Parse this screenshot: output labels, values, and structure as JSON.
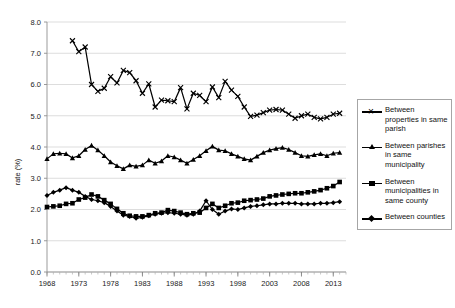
{
  "chart_data": {
    "type": "line",
    "title": "",
    "xlabel": "",
    "ylabel": "rate (%)",
    "ylim": [
      0.0,
      8.0
    ],
    "ytick_labels": [
      "0.0",
      "1.0",
      "2.0",
      "3.0",
      "4.0",
      "5.0",
      "6.0",
      "7.0",
      "8.0"
    ],
    "ytick_values": [
      0.0,
      1.0,
      2.0,
      3.0,
      4.0,
      5.0,
      6.0,
      7.0,
      8.0
    ],
    "xlim": [
      1968,
      2015
    ],
    "xtick_labels": [
      "1968",
      "1973",
      "1978",
      "1983",
      "1988",
      "1993",
      "1998",
      "2003",
      "2008",
      "2013"
    ],
    "xtick_values": [
      1968,
      1973,
      1978,
      1983,
      1988,
      1993,
      1998,
      2003,
      2008,
      2013
    ],
    "grid": "horizontal",
    "legend_position": "right",
    "x": [
      1968,
      1969,
      1970,
      1971,
      1972,
      1973,
      1974,
      1975,
      1976,
      1977,
      1978,
      1979,
      1980,
      1981,
      1982,
      1983,
      1984,
      1985,
      1986,
      1987,
      1988,
      1989,
      1990,
      1991,
      1992,
      1993,
      1994,
      1995,
      1996,
      1997,
      1998,
      1999,
      2000,
      2001,
      2002,
      2003,
      2004,
      2005,
      2006,
      2007,
      2008,
      2009,
      2010,
      2011,
      2012,
      2013,
      2014,
      2015
    ],
    "series": [
      {
        "name": "Between properties in same parish",
        "marker": "cross",
        "start_year": 1972,
        "values": [
          null,
          null,
          null,
          null,
          7.4,
          7.05,
          7.2,
          6.0,
          5.78,
          5.88,
          6.25,
          6.05,
          6.45,
          6.38,
          6.12,
          5.72,
          6.02,
          5.28,
          5.5,
          5.48,
          5.45,
          5.9,
          5.22,
          5.72,
          5.65,
          5.45,
          5.92,
          5.58,
          6.1,
          5.82,
          5.62,
          5.28,
          4.98,
          5.02,
          5.1,
          5.18,
          5.2,
          5.18,
          5.05,
          4.92,
          5.0,
          5.05,
          4.95,
          4.9,
          4.95,
          5.05,
          5.08,
          null
        ]
      },
      {
        "name": "Between parishes in same municipality",
        "marker": "triangle",
        "start_year": 1968,
        "values": [
          3.62,
          3.78,
          3.8,
          3.78,
          3.65,
          3.72,
          3.92,
          4.05,
          3.9,
          3.72,
          3.52,
          3.4,
          3.3,
          3.42,
          3.38,
          3.42,
          3.58,
          3.48,
          3.55,
          3.72,
          3.68,
          3.58,
          3.48,
          3.6,
          3.72,
          3.88,
          4.02,
          3.9,
          3.88,
          3.78,
          3.7,
          3.62,
          3.58,
          3.7,
          3.82,
          3.9,
          3.95,
          3.98,
          3.92,
          3.82,
          3.72,
          3.7,
          3.75,
          3.78,
          3.72,
          3.8,
          3.82,
          null
        ]
      },
      {
        "name": "Between municipalities in same county",
        "marker": "square",
        "start_year": 1968,
        "values": [
          2.08,
          2.1,
          2.12,
          2.18,
          2.2,
          2.32,
          2.38,
          2.48,
          2.42,
          2.3,
          2.18,
          2.02,
          1.88,
          1.8,
          1.78,
          1.78,
          1.82,
          1.88,
          1.9,
          1.98,
          1.95,
          1.9,
          1.85,
          1.88,
          1.9,
          2.05,
          2.18,
          2.05,
          2.12,
          2.2,
          2.22,
          2.28,
          2.3,
          2.32,
          2.35,
          2.42,
          2.45,
          2.48,
          2.5,
          2.52,
          2.52,
          2.55,
          2.58,
          2.62,
          2.68,
          2.75,
          2.88,
          null
        ]
      },
      {
        "name": "Between counties",
        "marker": "diamond",
        "start_year": 1968,
        "values": [
          2.45,
          2.55,
          2.62,
          2.7,
          2.62,
          2.55,
          2.42,
          2.32,
          2.28,
          2.22,
          2.1,
          1.95,
          1.82,
          1.78,
          1.72,
          1.75,
          1.8,
          1.85,
          1.88,
          1.9,
          1.88,
          1.85,
          1.82,
          1.85,
          1.95,
          2.28,
          2.0,
          1.85,
          1.95,
          2.02,
          2.0,
          2.05,
          2.1,
          2.12,
          2.15,
          2.18,
          2.18,
          2.2,
          2.2,
          2.2,
          2.18,
          2.18,
          2.18,
          2.2,
          2.2,
          2.22,
          2.25,
          null
        ]
      }
    ]
  },
  "legend": {
    "items": [
      {
        "label": "Between properties in same parish",
        "marker": "cross-marker"
      },
      {
        "label": "Between parishes in same municipality",
        "marker": "triangle-marker"
      },
      {
        "label": "Between municipalities in same county",
        "marker": "square-marker"
      },
      {
        "label": "Between counties",
        "marker": "diamond-marker"
      }
    ]
  }
}
